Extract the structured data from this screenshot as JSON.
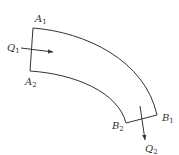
{
  "diagram": {
    "type": "curved-channel-flow",
    "colors": {
      "stroke": "#333333",
      "background": "#ffffff"
    },
    "labels": {
      "A1": {
        "main": "A",
        "sub": "1"
      },
      "A2": {
        "main": "A",
        "sub": "2"
      },
      "B1": {
        "main": "B",
        "sub": "1"
      },
      "B2": {
        "main": "B",
        "sub": "2"
      },
      "Q1": {
        "main": "Q",
        "sub": "1"
      },
      "Q2": {
        "main": "Q",
        "sub": "2"
      }
    },
    "arrows": [
      {
        "name": "inflow-Q1",
        "direction": "right"
      },
      {
        "name": "outflow-Q2",
        "direction": "down"
      }
    ]
  }
}
